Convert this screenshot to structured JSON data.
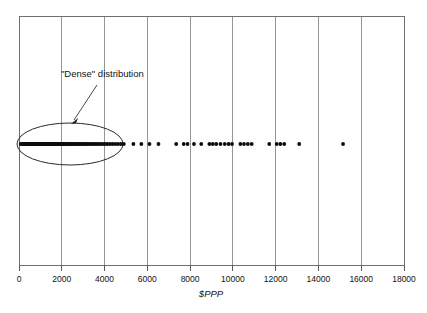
{
  "chart_data": {
    "type": "scatter",
    "title": "",
    "subtitle": "",
    "xlabel": "$PPP",
    "ylabel": "",
    "xlim": [
      0,
      18000
    ],
    "ylim": [
      0,
      1
    ],
    "grid": "vertical gridlines at every x tick",
    "legend": "none",
    "plot_note": "One-dimensional strip (dot) plot: all points share a single y value; only the x position carries information.",
    "x_ticks": [
      0,
      2000,
      4000,
      6000,
      8000,
      10000,
      12000,
      14000,
      16000,
      18000
    ],
    "x_tick_labels": [
      "0",
      "2000",
      "4000",
      "6000",
      "8000",
      "10000",
      "12000",
      "14000",
      "16000",
      "18000"
    ],
    "y_ticks": [],
    "y_tick_labels": [],
    "series": [
      {
        "name": "observations",
        "marker": "filled circle",
        "marker_color": "#0d0d0d",
        "y_value": 0.5,
        "values": [
          80,
          150,
          210,
          260,
          300,
          340,
          370,
          400,
          430,
          455,
          480,
          505,
          530,
          550,
          575,
          595,
          615,
          635,
          655,
          675,
          695,
          715,
          735,
          755,
          775,
          795,
          815,
          835,
          855,
          875,
          895,
          915,
          940,
          960,
          985,
          1005,
          1030,
          1050,
          1075,
          1100,
          1125,
          1150,
          1175,
          1200,
          1230,
          1255,
          1285,
          1310,
          1340,
          1370,
          1400,
          1430,
          1460,
          1490,
          1520,
          1555,
          1590,
          1620,
          1655,
          1690,
          1725,
          1760,
          1800,
          1840,
          1880,
          1920,
          1960,
          2000,
          2045,
          2090,
          2135,
          2180,
          2230,
          2280,
          2330,
          2380,
          2435,
          2490,
          2545,
          2600,
          2660,
          2720,
          2785,
          2850,
          2915,
          2985,
          3055,
          3130,
          3205,
          3285,
          3365,
          3450,
          3540,
          3630,
          3725,
          3820,
          3920,
          4025,
          4135,
          4250,
          4370,
          4495,
          4625,
          4760,
          4900,
          5350,
          5720,
          6100,
          6520,
          7350,
          7700,
          7880,
          8180,
          8520,
          8900,
          9060,
          9220,
          9420,
          9620,
          9800,
          9960,
          10350,
          10520,
          10700,
          10880,
          11700,
          12050,
          12220,
          12400,
          13100,
          15150
        ]
      }
    ],
    "annotations": [
      {
        "name": "dense-distribution-callout",
        "text": "\"Dense\" distribution",
        "points_to": "cluster of overlapping observations between roughly 0 and 4900 $PPP",
        "shape": "ellipse"
      }
    ]
  },
  "axis": {
    "x_label": "$PPP",
    "tick_labels": [
      "0",
      "2000",
      "4000",
      "6000",
      "8000",
      "10000",
      "12000",
      "14000",
      "16000",
      "18000"
    ]
  },
  "annotation": {
    "label": "\"Dense\" distribution"
  },
  "colors": {
    "point": "#0d0d0d",
    "grid": "#8c8c8c",
    "frame": "#6f6f6f",
    "ellipse": "#2b2b2b",
    "arrow": "#4a4a4a",
    "text": "#111111",
    "background": "#ffffff"
  }
}
